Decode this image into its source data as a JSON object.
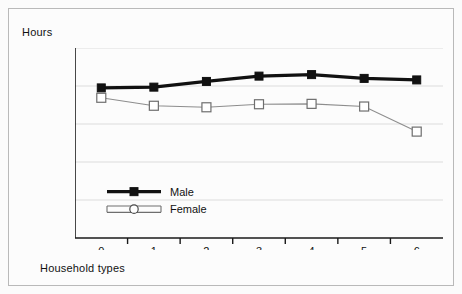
{
  "chart_data": {
    "type": "line",
    "title": "",
    "xlabel": "Household types",
    "ylabel": "Hours",
    "categories": [
      "0",
      "1",
      "2",
      "3",
      "4",
      "5",
      "6"
    ],
    "x": [
      0,
      1,
      2,
      3,
      4,
      5,
      6
    ],
    "ylim": [
      0,
      50
    ],
    "yticks": [
      0,
      10,
      20,
      30,
      40,
      50
    ],
    "ytick_labels": [
      "0",
      "10",
      "20",
      "30",
      "40",
      "50"
    ],
    "xtick_labels": [
      "0",
      "1",
      "2",
      "3",
      "4",
      "5",
      "6"
    ],
    "grid": true,
    "grid_axis": "y",
    "legend_position": "inside-lower-left",
    "series": [
      {
        "name": "Male",
        "marker": "filled-square",
        "color": "#111111",
        "values": [
          39.5,
          39.7,
          41.2,
          42.6,
          43.0,
          42.0,
          41.6
        ]
      },
      {
        "name": "Female",
        "marker": "open-square",
        "color": "#8d8d8d",
        "values": [
          36.9,
          34.8,
          34.4,
          35.2,
          35.3,
          34.6,
          28.0
        ]
      }
    ]
  },
  "legend": {
    "items": [
      {
        "label": "Male",
        "marker": "filled-square"
      },
      {
        "label": "Female",
        "marker": "open-circle"
      }
    ]
  },
  "axis": {
    "y_title": "Hours",
    "x_title": "Household types"
  }
}
